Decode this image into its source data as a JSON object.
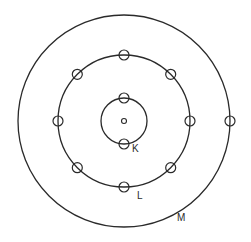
{
  "diagram": {
    "type": "atomic-shell-model",
    "nucleus": {
      "cx": 124,
      "cy": 121,
      "r": 2.5
    },
    "shells": [
      {
        "name": "K",
        "label": "K",
        "cx": 124,
        "cy": 121,
        "r": 23,
        "electrons": 2,
        "label_x": 132,
        "label_y": 152
      },
      {
        "name": "L",
        "label": "L",
        "cx": 124,
        "cy": 121,
        "r": 66,
        "electrons": 8,
        "label_x": 137,
        "label_y": 199
      },
      {
        "name": "M",
        "label": "M",
        "cx": 124,
        "cy": 121,
        "r": 106,
        "electrons": 1,
        "label_x": 177,
        "label_y": 221
      }
    ],
    "electron_radius": 5,
    "colors": {
      "stroke": "#2a2a2a",
      "background": "#ffffff"
    }
  }
}
